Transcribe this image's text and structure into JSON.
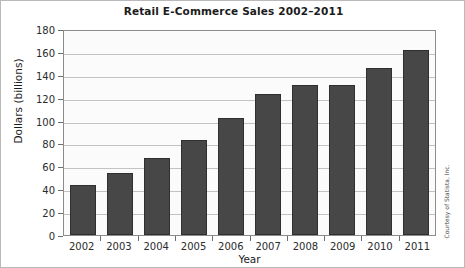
{
  "chart_data": {
    "type": "bar",
    "title": "Retail E-Commerce Sales 2002–2011",
    "xlabel": "Year",
    "ylabel": "Dollars (billions)",
    "categories": [
      "2002",
      "2003",
      "2004",
      "2005",
      "2006",
      "2007",
      "2008",
      "2009",
      "2010",
      "2011"
    ],
    "values": [
      44,
      54,
      67,
      83,
      102,
      123,
      131,
      131,
      146,
      162
    ],
    "ylim": [
      0,
      180
    ],
    "yticks": [
      0,
      20,
      40,
      60,
      80,
      100,
      120,
      140,
      160,
      180
    ],
    "ytick_labels": [
      "0",
      "20",
      "40",
      "60",
      "80",
      "100",
      "120",
      "140",
      "160",
      "180"
    ],
    "grid": true,
    "legend": false,
    "bar_color": "#474747",
    "plot_background": "#fbfbfb",
    "gridline_color": "#c2c2c2"
  },
  "credit": "Courtesy of Statista, Inc."
}
